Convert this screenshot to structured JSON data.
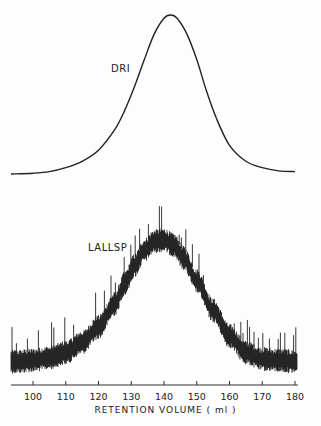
{
  "chart_data": [
    {
      "type": "line",
      "title": "",
      "series": [
        {
          "name": "DRI",
          "description": "Differential refractive index detector trace; smooth Gaussian-like peak",
          "x": [
            95,
            100,
            105,
            110,
            115,
            120,
            125,
            128,
            131,
            134,
            137,
            140,
            142,
            144,
            147,
            150,
            153,
            156,
            160,
            165,
            170,
            175,
            180
          ],
          "y": [
            0.0,
            0.005,
            0.015,
            0.04,
            0.08,
            0.15,
            0.28,
            0.4,
            0.55,
            0.72,
            0.88,
            0.98,
            1.0,
            0.98,
            0.88,
            0.72,
            0.52,
            0.35,
            0.18,
            0.08,
            0.04,
            0.02,
            0.015
          ]
        },
        {
          "name": "LALLSP",
          "description": "Low-angle laser light scattering photometer trace; noisy peak with high-frequency spikes",
          "x": [
            95,
            100,
            105,
            110,
            115,
            120,
            125,
            128,
            131,
            134,
            137,
            140,
            143,
            146,
            150,
            155,
            160,
            165,
            170,
            175,
            180
          ],
          "y": [
            0.05,
            0.06,
            0.08,
            0.12,
            0.2,
            0.32,
            0.5,
            0.66,
            0.8,
            0.92,
            0.99,
            1.0,
            0.96,
            0.86,
            0.68,
            0.45,
            0.25,
            0.12,
            0.07,
            0.06,
            0.05
          ]
        }
      ],
      "xlabel": "RETENTION VOLUME (ml)",
      "ylabel": "",
      "x_ticks": [
        "100",
        "110",
        "120",
        "130",
        "140",
        "150",
        "160",
        "170",
        "180"
      ],
      "xlim": [
        93,
        181
      ],
      "annotations": [
        "DRI",
        "LALLSP"
      ],
      "grid": false,
      "legend": "none (curves labeled inline)"
    }
  ],
  "labels": {
    "dri": "DRI",
    "lallsp": "LALLSP",
    "xlabel": "RETENTION VOLUME ( ml )"
  },
  "axis": {
    "ticks": [
      "100",
      "110",
      "120",
      "130",
      "140",
      "150",
      "160",
      "170",
      "180"
    ]
  }
}
